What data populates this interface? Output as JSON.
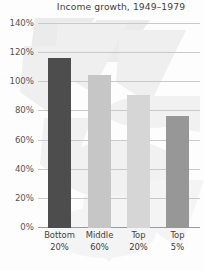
{
  "chart_data": {
    "type": "bar",
    "title": "Income growth, 1949–1979",
    "xlabel": "",
    "ylabel": "",
    "categories": [
      "Bottom 20%",
      "Middle 60%",
      "Top 20%",
      "Top 5%"
    ],
    "category_lines": [
      {
        "line1": "Bottom",
        "line2": "20%"
      },
      {
        "line1": "Middle",
        "line2": "60%"
      },
      {
        "line1": "Top",
        "line2": "20%"
      },
      {
        "line1": "Top",
        "line2": "5%"
      }
    ],
    "values": [
      117,
      105,
      91,
      77
    ],
    "value_labels": [
      "117%",
      "105%",
      "91%",
      "77%"
    ],
    "bar_colors": [
      "#4d4d4d",
      "#c6c6c6",
      "#d6d6d6",
      "#979797"
    ],
    "ylim": [
      0,
      140
    ],
    "ytick_values": [
      0,
      20,
      40,
      60,
      80,
      100,
      120,
      140
    ],
    "ytick_labels": [
      "0%",
      "20%",
      "40%",
      "60%",
      "80%",
      "100%",
      "120%",
      "140%"
    ],
    "grid": true,
    "legend": false,
    "legend_position": "none",
    "gridline_color": "#c9c9c9",
    "axis_color": "#9a9a9a",
    "background_color": "#fdfdfd",
    "text_color": "#3f3f3f"
  }
}
